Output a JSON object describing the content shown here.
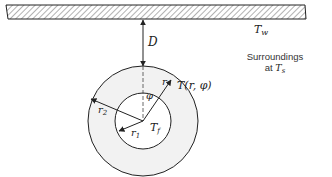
{
  "diagram": {
    "wall": {
      "label": "T",
      "label_sub": "w"
    },
    "gap": {
      "label": "D"
    },
    "surroundings": {
      "line1": "Surroundings",
      "line2_prefix": "at ",
      "line2_var": "T",
      "line2_sub": "s"
    },
    "angle": {
      "label": "φ"
    },
    "radial": {
      "label": "r"
    },
    "point_temp": {
      "label": "T(r, φ)"
    },
    "outer_radius": {
      "label": "r",
      "sub": "2"
    },
    "inner_radius": {
      "label": "r",
      "sub": "1"
    },
    "fluid_temp": {
      "label": "T",
      "sub": "f"
    },
    "colors": {
      "line": "#222222",
      "annulus_fill": "#f2f2f2",
      "hatch": "#555555"
    }
  }
}
